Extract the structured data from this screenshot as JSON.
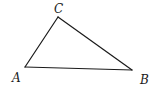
{
  "diagram": {
    "type": "triangle",
    "vertices": [
      {
        "id": "A",
        "label": "A",
        "x": 25,
        "y": 67,
        "label_x": 12,
        "label_y": 82
      },
      {
        "id": "B",
        "label": "B",
        "x": 132,
        "y": 70,
        "label_x": 140,
        "label_y": 84
      },
      {
        "id": "C",
        "label": "C",
        "x": 58,
        "y": 17,
        "label_x": 54,
        "label_y": 13
      }
    ],
    "edges": [
      {
        "from": "A",
        "to": "C"
      },
      {
        "from": "C",
        "to": "B"
      },
      {
        "from": "A",
        "to": "B"
      }
    ],
    "colors": {
      "stroke": "#1a1a1a",
      "background": "#ffffff"
    }
  }
}
